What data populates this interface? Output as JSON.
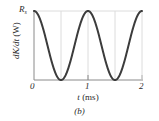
{
  "figure": {
    "caption": "(b)",
    "panel_letter": "b",
    "background_color": "#ffffff",
    "curve_color": "#3c3c3c",
    "axis_color": "#6e6e6e",
    "grid_color": "#d8d8d8",
    "text_color": "#2b2b2b"
  },
  "axes": {
    "y_axis_title": "dK/dt",
    "y_axis_units": "(W)",
    "y_peak_label": "R",
    "y_peak_label_subscript": "s",
    "x_axis_title": "t",
    "x_axis_units": "(ms)",
    "x_tick_labels": [
      "0",
      "1",
      "2"
    ],
    "y_tick_labels": [
      "R"
    ],
    "grid": "faint vertical gridlines at t = 0.5, 1.0, 1.5 and horizontal gridline at y = R"
  },
  "chart_data": {
    "type": "line",
    "title": "",
    "subtitle": "",
    "xlabel": "t (ms)",
    "ylabel": "dK/dt (W)",
    "xlim": [
      0,
      2
    ],
    "ylim": [
      0,
      1
    ],
    "xticks": [
      0,
      1,
      2
    ],
    "xticklabels": [
      "0",
      "1",
      "2"
    ],
    "yticks": [
      1
    ],
    "yticklabels": [
      "R_s"
    ],
    "grid": true,
    "gridlines_x": [
      0.5,
      1.0,
      1.5
    ],
    "gridlines_y": [
      1.0
    ],
    "legend": null,
    "legend_position": "none",
    "annotations": [
      "(b)"
    ],
    "series": [
      {
        "name": "dK/dt",
        "description": "Raised cosine-squared: dK/dt = R_s * cos^2(pi * t), period 1 ms, maxima R_s at t = 0, 1, 2; minima 0 at t = 0.5, 1.5",
        "formula": "R_s*cos(pi*t)^2",
        "amplitude_label": "R_s",
        "period_ms": 1,
        "x": [
          0.0,
          0.05,
          0.1,
          0.15,
          0.2,
          0.25,
          0.3,
          0.35,
          0.4,
          0.45,
          0.5,
          0.55,
          0.6,
          0.65,
          0.7,
          0.75,
          0.8,
          0.85,
          0.9,
          0.95,
          1.0,
          1.05,
          1.1,
          1.15,
          1.2,
          1.25,
          1.3,
          1.35,
          1.4,
          1.45,
          1.5,
          1.55,
          1.6,
          1.65,
          1.7,
          1.75,
          1.8,
          1.85,
          1.9,
          1.95,
          2.0
        ],
        "y": [
          1.0,
          0.976,
          0.905,
          0.794,
          0.655,
          0.5,
          0.345,
          0.206,
          0.095,
          0.024,
          0.0,
          0.024,
          0.095,
          0.206,
          0.345,
          0.5,
          0.655,
          0.794,
          0.905,
          0.976,
          1.0,
          0.976,
          0.905,
          0.794,
          0.655,
          0.5,
          0.345,
          0.206,
          0.095,
          0.024,
          0.0,
          0.024,
          0.095,
          0.206,
          0.345,
          0.5,
          0.655,
          0.794,
          0.905,
          0.976,
          1.0
        ]
      }
    ]
  }
}
